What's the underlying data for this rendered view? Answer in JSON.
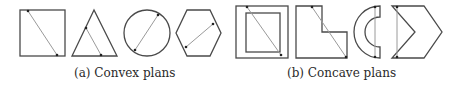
{
  "figure": {
    "colors": {
      "outline": "#4a4a4a",
      "chord": "#9a9a9a",
      "dot": "#222222",
      "background": "#ffffff"
    },
    "groups": [
      {
        "caption": "(a) Convex plans",
        "shapes": [
          "square",
          "triangle",
          "circle",
          "hexagon"
        ]
      },
      {
        "caption": "(b) Concave plans",
        "shapes": [
          "square-with-hole",
          "l-shape",
          "half-ring",
          "chevron"
        ]
      }
    ]
  }
}
